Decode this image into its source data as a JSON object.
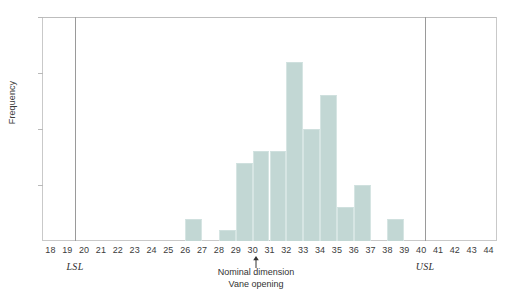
{
  "chart_data": {
    "type": "bar",
    "title": "",
    "subtitle": "",
    "xlabel": "Vane opening",
    "ylabel": "Frequency",
    "xlim": [
      17.5,
      44.5
    ],
    "ylim": [
      0,
      20
    ],
    "grid": false,
    "legend": null,
    "y_ticks": [
      5,
      10,
      15,
      20
    ],
    "x_ticks": [
      18,
      19,
      20,
      21,
      22,
      23,
      24,
      25,
      26,
      27,
      28,
      29,
      30,
      31,
      32,
      33,
      34,
      35,
      36,
      37,
      38,
      39,
      40,
      41,
      42,
      43,
      44
    ],
    "bar_color": "#c2d7d4",
    "bin_edges": [
      26,
      27,
      28,
      29,
      30,
      31,
      32,
      33,
      34,
      35,
      36,
      37,
      38,
      39
    ],
    "categories": [
      "26-27",
      "27-28",
      "28-29",
      "29-30",
      "30-31",
      "31-32",
      "32-33",
      "33-34",
      "34-35",
      "35-36",
      "36-37",
      "37-38",
      "38-39"
    ],
    "values": [
      2,
      0,
      1,
      7,
      8,
      8,
      16,
      10,
      13,
      3,
      5,
      0,
      2
    ],
    "bars": [
      {
        "bin_start": 26,
        "bin_end": 27,
        "value": 2
      },
      {
        "bin_start": 28,
        "bin_end": 29,
        "value": 1
      },
      {
        "bin_start": 29,
        "bin_end": 30,
        "value": 7
      },
      {
        "bin_start": 30,
        "bin_end": 31,
        "value": 8
      },
      {
        "bin_start": 31,
        "bin_end": 32,
        "value": 8
      },
      {
        "bin_start": 32,
        "bin_end": 33,
        "value": 16
      },
      {
        "bin_start": 33,
        "bin_end": 34,
        "value": 10
      },
      {
        "bin_start": 34,
        "bin_end": 35,
        "value": 13
      },
      {
        "bin_start": 35,
        "bin_end": 36,
        "value": 3
      },
      {
        "bin_start": 36,
        "bin_end": 37,
        "value": 5
      },
      {
        "bin_start": 38,
        "bin_end": 39,
        "value": 2
      }
    ],
    "annotations": [
      {
        "name": "lsl",
        "label": "LSL",
        "x": 19.5,
        "type": "vline"
      },
      {
        "name": "usl",
        "label": "USL",
        "x": 40.2,
        "type": "vline"
      },
      {
        "name": "nominal",
        "label_line1": "Nominal dimension",
        "label_line2": "Vane opening",
        "x": 30.5,
        "type": "arrow-up"
      }
    ]
  },
  "axes": {
    "y_title": "Frequency",
    "y_tick_labels": [
      "20",
      "15",
      "10",
      "5"
    ],
    "x_tick_labels": [
      "18",
      "19",
      "20",
      "21",
      "22",
      "23",
      "24",
      "25",
      "26",
      "27",
      "28",
      "29",
      "30",
      "31",
      "32",
      "33",
      "34",
      "35",
      "36",
      "37",
      "38",
      "39",
      "40",
      "41",
      "42",
      "43",
      "44"
    ]
  },
  "annotations": {
    "lsl_label": "LSL",
    "usl_label": "USL",
    "nominal_line1": "Nominal dimension",
    "nominal_line2": "Vane opening"
  }
}
